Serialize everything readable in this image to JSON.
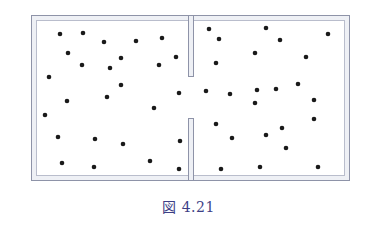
{
  "figure": {
    "caption": "図 4.21",
    "colors": {
      "wall_outer": "#8e93a8",
      "wall_inner": "#b9bdcc",
      "wall_fill": "#eef0f5",
      "particle": "#1a1a1a",
      "caption": "#3d3f86"
    },
    "box": {
      "outer": {
        "x": 31,
        "y": 15,
        "w": 318,
        "h": 165
      },
      "inner": {
        "x": 36,
        "y": 20,
        "w": 308,
        "h": 155
      },
      "divider": {
        "x": 188,
        "w": 5,
        "upper_end_y": 76,
        "lower_start_y": 118
      }
    },
    "particles_left": [
      [
        60,
        34
      ],
      [
        83,
        33
      ],
      [
        104,
        42
      ],
      [
        136,
        41
      ],
      [
        162,
        38
      ],
      [
        68,
        53
      ],
      [
        82,
        65
      ],
      [
        121,
        58
      ],
      [
        110,
        68
      ],
      [
        159,
        65
      ],
      [
        176,
        57
      ],
      [
        49,
        77
      ],
      [
        121,
        85
      ],
      [
        67,
        101
      ],
      [
        107,
        97
      ],
      [
        154,
        108
      ],
      [
        179,
        93
      ],
      [
        45,
        115
      ],
      [
        58,
        137
      ],
      [
        95,
        139
      ],
      [
        123,
        144
      ],
      [
        180,
        141
      ],
      [
        62,
        163
      ],
      [
        94,
        167
      ],
      [
        150,
        161
      ],
      [
        179,
        169
      ]
    ],
    "particles_right": [
      [
        209,
        29
      ],
      [
        219,
        39
      ],
      [
        266,
        28
      ],
      [
        280,
        40
      ],
      [
        328,
        34
      ],
      [
        255,
        53
      ],
      [
        306,
        57
      ],
      [
        216,
        63
      ],
      [
        206,
        91
      ],
      [
        230,
        94
      ],
      [
        257,
        90
      ],
      [
        276,
        89
      ],
      [
        298,
        84
      ],
      [
        255,
        103
      ],
      [
        314,
        100
      ],
      [
        314,
        119
      ],
      [
        216,
        124
      ],
      [
        232,
        138
      ],
      [
        266,
        135
      ],
      [
        282,
        128
      ],
      [
        286,
        148
      ],
      [
        221,
        169
      ],
      [
        260,
        167
      ],
      [
        318,
        167
      ]
    ]
  }
}
